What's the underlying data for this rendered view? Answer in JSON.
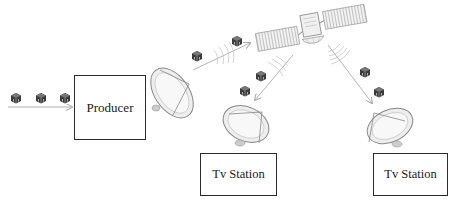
{
  "diagram": {
    "nodes": {
      "producer": {
        "label": "Producer"
      },
      "tv_station_1": {
        "label": "Tv Station"
      },
      "tv_station_2": {
        "label": "Tv Station"
      }
    },
    "icons": {
      "packet": "package-cube-icon",
      "uplink_dish": "satellite-dish-icon",
      "satellite": "satellite-icon",
      "downlink_dish": "satellite-dish-icon",
      "signal": "signal-waves-icon"
    },
    "flow": [
      "packets -> Producer",
      "Producer -> uplink dish",
      "uplink dish -> satellite",
      "satellite -> Tv Station (left)",
      "satellite -> Tv Station (right)"
    ],
    "colors": {
      "box_border": "#2b2b2b",
      "arrow": "#b0b0b0",
      "dish": "#e6e6e6",
      "packet": "#3a3a3a"
    }
  }
}
